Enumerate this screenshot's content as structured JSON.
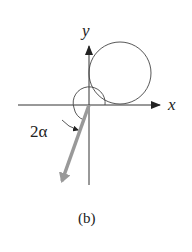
{
  "figure": {
    "caption": "(b)",
    "axes": {
      "x_label": "x",
      "y_label": "y"
    },
    "angle_label": "2α",
    "colors": {
      "axis": "#333333",
      "vector": "#999999",
      "background": "#ffffff"
    }
  }
}
